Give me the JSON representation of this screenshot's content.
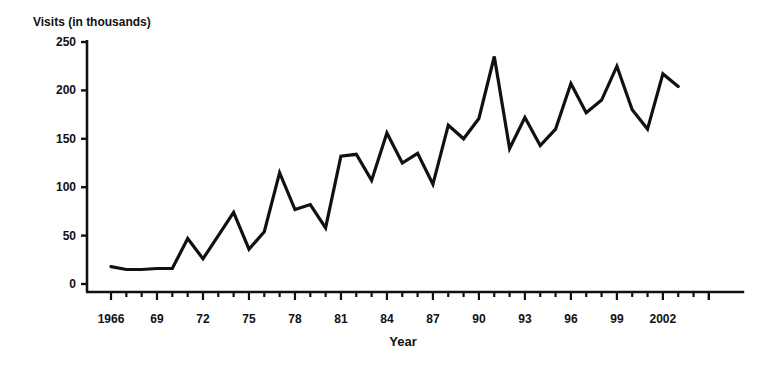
{
  "chart_data": {
    "type": "line",
    "title": "",
    "ylabel": "Visits (in thousands)",
    "xlabel": "Year",
    "ylim": [
      0,
      250
    ],
    "yticks": [
      0,
      50,
      100,
      150,
      200,
      250
    ],
    "xlim": [
      1966,
      2006
    ],
    "xtick_labels": [
      {
        "year": 1966,
        "label": "1966"
      },
      {
        "year": 1969,
        "label": "69"
      },
      {
        "year": 1972,
        "label": "72"
      },
      {
        "year": 1975,
        "label": "75"
      },
      {
        "year": 1978,
        "label": "78"
      },
      {
        "year": 1981,
        "label": "81"
      },
      {
        "year": 1984,
        "label": "84"
      },
      {
        "year": 1987,
        "label": "87"
      },
      {
        "year": 1990,
        "label": "90"
      },
      {
        "year": 1993,
        "label": "93"
      },
      {
        "year": 1996,
        "label": "96"
      },
      {
        "year": 1999,
        "label": "99"
      },
      {
        "year": 2002,
        "label": "2002"
      }
    ],
    "grid": false,
    "legend": null,
    "x": [
      1966,
      1967,
      1968,
      1969,
      1970,
      1971,
      1972,
      1973,
      1974,
      1975,
      1976,
      1977,
      1978,
      1979,
      1980,
      1981,
      1982,
      1983,
      1984,
      1985,
      1986,
      1987,
      1988,
      1989,
      1990,
      1991,
      1992,
      1993,
      1994,
      1995,
      1996,
      1997,
      1998,
      1999,
      2000,
      2001,
      2002,
      2003
    ],
    "series": [
      {
        "name": "Visits",
        "color": "#111111",
        "values": [
          18,
          15,
          15,
          16,
          16,
          47,
          26,
          50,
          74,
          36,
          54,
          115,
          77,
          82,
          58,
          132,
          134,
          107,
          156,
          125,
          135,
          103,
          164,
          150,
          171,
          235,
          140,
          172,
          143,
          160,
          207,
          177,
          190,
          225,
          180,
          160,
          217,
          204
        ]
      }
    ]
  }
}
